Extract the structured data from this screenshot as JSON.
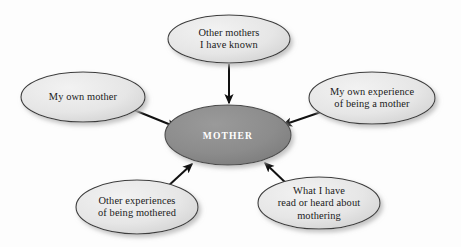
{
  "diagram": {
    "type": "concept-map",
    "center": {
      "id": "mother",
      "label": "MOTHER",
      "fill": "#8c8c8c",
      "stroke": "#4a4a4a",
      "text_color": "#ffffff",
      "cx": 228,
      "cy": 135,
      "rx": 63,
      "ry": 30
    },
    "nodes": [
      {
        "id": "other-mothers-known",
        "label": "Other mothers\nI have known",
        "fill": "#e3e3e3",
        "stroke": "#3c3c3c",
        "cx": 229,
        "cy": 39,
        "rx": 61,
        "ry": 24,
        "position": "top"
      },
      {
        "id": "my-own-mother",
        "label": "My own mother",
        "fill": "#e3e3e3",
        "stroke": "#3c3c3c",
        "cx": 83,
        "cy": 97,
        "rx": 62,
        "ry": 25,
        "position": "left"
      },
      {
        "id": "my-own-experience",
        "label": "My own experience\nof being a mother",
        "fill": "#e3e3e3",
        "stroke": "#3c3c3c",
        "cx": 372,
        "cy": 98,
        "rx": 63,
        "ry": 26,
        "position": "right"
      },
      {
        "id": "other-experiences-mothered",
        "label": "Other experiences\nof being mothered",
        "fill": "#e3e3e3",
        "stroke": "#3c3c3c",
        "cx": 137,
        "cy": 207,
        "rx": 61,
        "ry": 27,
        "position": "bottom-left"
      },
      {
        "id": "read-or-heard",
        "label": "What I have\nread or heard about\nmothering",
        "fill": "#e3e3e3",
        "stroke": "#3c3c3c",
        "cx": 319,
        "cy": 203,
        "rx": 61,
        "ry": 26,
        "position": "bottom-right"
      }
    ],
    "arrows": [
      {
        "id": "arrow-top",
        "from": "other-mothers-known",
        "to": "mother",
        "x1": 229,
        "y1": 64,
        "x2": 229,
        "y2": 103
      },
      {
        "id": "arrow-left",
        "from": "my-own-mother",
        "to": "mother",
        "x1": 134,
        "y1": 110,
        "x2": 176,
        "y2": 127
      },
      {
        "id": "arrow-right",
        "from": "my-own-experience",
        "to": "mother",
        "x1": 321,
        "y1": 112,
        "x2": 283,
        "y2": 125
      },
      {
        "id": "arrow-bottom-left",
        "from": "other-experiences-mothered",
        "to": "mother",
        "x1": 166,
        "y1": 188,
        "x2": 192,
        "y2": 164
      },
      {
        "id": "arrow-bottom-right",
        "from": "read-or-heard",
        "to": "mother",
        "x1": 288,
        "y1": 185,
        "x2": 265,
        "y2": 163
      }
    ],
    "colors": {
      "node_fill": "#e3e3e3",
      "node_stroke": "#3c3c3c",
      "center_fill": "#8c8c8c",
      "arrow": "#111111",
      "background": "#fdfdfd"
    }
  }
}
